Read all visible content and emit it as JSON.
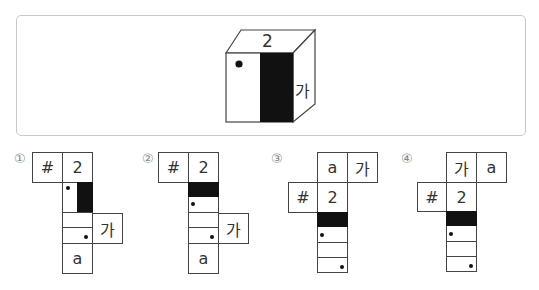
{
  "question": {
    "cube": {
      "top_label": "2",
      "right_label": "가",
      "front_face": "dot top-left, black vertical band on right half"
    }
  },
  "options": [
    {
      "marker": "①",
      "cells": {
        "a": "#",
        "b": "2",
        "c": "가",
        "d": "a"
      }
    },
    {
      "marker": "②",
      "cells": {
        "a": "#",
        "b": "2",
        "c": "가",
        "d": "a"
      }
    },
    {
      "marker": "③",
      "cells": {
        "a": "a",
        "b": "가",
        "c": "#",
        "d": "2"
      }
    },
    {
      "marker": "④",
      "cells": {
        "a": "가",
        "b": "a",
        "c": "#",
        "d": "2"
      }
    }
  ],
  "colors": {
    "line": "#444444",
    "fill": "#111111",
    "frame": "#c8c8c8"
  }
}
